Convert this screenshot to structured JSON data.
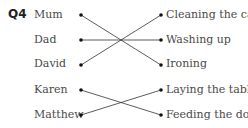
{
  "question": {
    "number": "Q4"
  },
  "left_items": [
    "Mum",
    "Dad",
    "David",
    "Karen",
    "Matthew"
  ],
  "right_items": [
    "Cleaning the car",
    "Washing up",
    "Ironing",
    "Laying the table",
    "Feeding the dog"
  ],
  "matches": [
    {
      "from": "Mum",
      "to": "Ironing"
    },
    {
      "from": "Dad",
      "to": "Washing up"
    },
    {
      "from": "David",
      "to": "Cleaning the car"
    },
    {
      "from": "Karen",
      "to": "Feeding the dog"
    },
    {
      "from": "Matthew",
      "to": "Laying the table"
    }
  ]
}
